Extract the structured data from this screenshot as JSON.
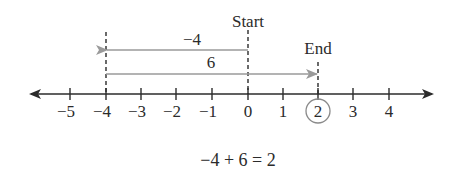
{
  "number_line": {
    "min_tick": -5,
    "max_tick": 4,
    "ticks": [
      "−5",
      "−4",
      "−3",
      "−2",
      "−1",
      "0",
      "1",
      "2",
      "3",
      "4"
    ],
    "circled_value": "2"
  },
  "markers": {
    "start_label": "Start",
    "end_label": "End"
  },
  "arrows": [
    {
      "label": "−4",
      "from": 0,
      "to": -4,
      "direction": "left"
    },
    {
      "label": "6",
      "from": -4,
      "to": 2,
      "direction": "right"
    }
  ],
  "equation": "−4 + 6 = 2",
  "colors": {
    "axis": "#2b2b2b",
    "movement_arrow": "#9a9a9a",
    "circle": "#8a8a8a"
  }
}
